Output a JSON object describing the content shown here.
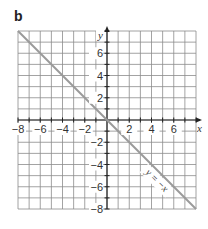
{
  "panel": {
    "label": "b"
  },
  "chart_data": {
    "type": "line",
    "title": "",
    "xlabel": "x",
    "ylabel": "y",
    "xlim": [
      -8,
      8
    ],
    "ylim": [
      -8,
      8
    ],
    "grid": true,
    "grid_step": 1,
    "x_ticks": [
      -8,
      -6,
      -4,
      -2,
      2,
      4,
      6
    ],
    "y_ticks": [
      6,
      4,
      2,
      -2,
      -4,
      -6,
      -8
    ],
    "x_tick_labels": [
      "−8",
      "−6",
      "−4",
      "−2",
      "2",
      "4",
      "6"
    ],
    "y_tick_labels": [
      "6",
      "4",
      "2",
      "−2",
      "−4",
      "−6",
      "−8"
    ],
    "series": [
      {
        "name": "y = −x",
        "x": [
          -8,
          8
        ],
        "y": [
          8,
          -8
        ],
        "color": "#9a9a9a"
      }
    ],
    "annotations": [
      {
        "text": "y = −x",
        "x": 5,
        "y": -6,
        "rotation": 45
      }
    ]
  },
  "colors": {
    "grid": "#8c8c8c",
    "axis": "#222222",
    "line": "#9a9a9a"
  }
}
